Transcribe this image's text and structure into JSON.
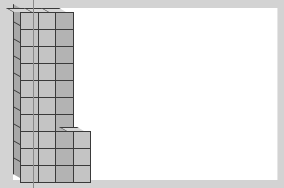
{
  "scene": {
    "description": "3D stacked unit cubes",
    "colors": {
      "background": "#d3d3d3",
      "panel": "#ffffff",
      "cube_front_light": "#c4c4c4",
      "cube_front_dark": "#b3b3b3",
      "cube_side": "#a8a8a8",
      "cube_top": "#d6d6d6",
      "edge": "#3a3a3a"
    },
    "columns": [
      {
        "index": 1,
        "height": 10
      },
      {
        "index": 2,
        "height": 10
      },
      {
        "index": 3,
        "height": 10
      },
      {
        "index": 4,
        "height": 3
      }
    ],
    "total_cubes": 33
  }
}
